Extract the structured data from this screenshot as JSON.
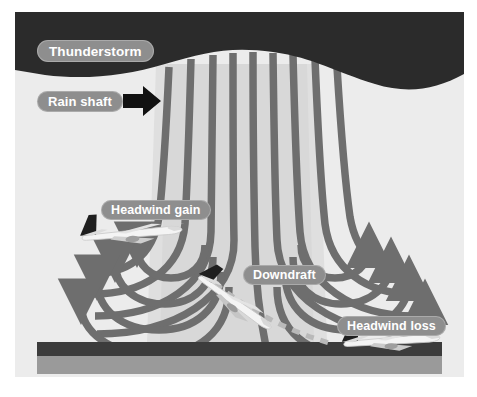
{
  "figure": {
    "width": 477,
    "height": 397
  },
  "labels": {
    "thunderstorm": "Thunderstorm",
    "rain_shaft": "Rain shaft",
    "headwind_gain": "Headwind gain",
    "downdraft": "Downdraft",
    "headwind_loss": "Headwind loss"
  },
  "colors": {
    "background": "#ffffff",
    "sky": "#ececec",
    "storm_cloud": "#2b2b2b",
    "rain_shaft": "#dcdcdc",
    "streamline": "#6e6e6e",
    "ground_dark": "#3c3c3c",
    "ground_light": "#9a9a9a",
    "label_pill": "#8e8e8e",
    "label_text": "#ffffff",
    "arrow_black": "#111111",
    "aircraft_body": "#f2f2f2",
    "aircraft_tail": "#1f1f1f",
    "flight_path": "#b8b8b8"
  },
  "elements": {
    "storm_cloud": {
      "name": "thunderstorm-cloud",
      "description": "Dark cloud base with wavy lower edge spanning the top of the scene"
    },
    "rain_shaft": {
      "name": "rain-shaft-column",
      "description": "Light grey vertical column of precipitation descending from the cloud base to the ground",
      "arrow_direction": "right"
    },
    "downdraft": {
      "name": "downdraft-streamlines",
      "description": "Vertical streamlines descending from cloud, spreading outward near the surface",
      "streamline_count": 9
    },
    "outflow_left": {
      "name": "outflow-curves-left",
      "arrow_direction": "left",
      "curve_count": 4
    },
    "outflow_right": {
      "name": "outflow-curves-right",
      "arrow_direction": "right",
      "curve_count": 4
    },
    "ground": {
      "name": "ground-surface",
      "description": "Dark runway band with lighter terrain band below"
    }
  },
  "aircraft": [
    {
      "id": "aircraft-headwind-gain",
      "phase": "Headwind gain",
      "attitude": "level approach",
      "position": "upwind side of the microburst, left of the downdraft core"
    },
    {
      "id": "aircraft-downdraft",
      "phase": "Downdraft",
      "attitude": "nose-down descent through the core",
      "position": "centre of the microburst"
    },
    {
      "id": "aircraft-headwind-loss",
      "phase": "Headwind loss",
      "attitude": "low, sinking toward the surface",
      "position": "downwind side, near the ground"
    }
  ],
  "flight_path": {
    "name": "flight-path-trajectory",
    "style": "dashed",
    "description": "Dashed descent trajectory from the downdraft aircraft to the ground aircraft"
  }
}
